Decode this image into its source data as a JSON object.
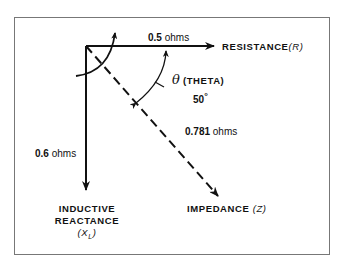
{
  "diagram": {
    "resistance": {
      "value": "0.5",
      "unit": "ohms",
      "label": "RESISTANCE",
      "symbol": "(R)"
    },
    "inductive_reactance": {
      "value": "0.6",
      "unit": "ohms",
      "label_line1": "INDUCTIVE",
      "label_line2": "REACTANCE",
      "symbol": "(X",
      "symbol_sub": "L",
      "symbol_close": ")"
    },
    "impedance": {
      "value": "0.781",
      "unit": "ohms",
      "label": "IMPEDANCE",
      "symbol": "(Z)"
    },
    "angle": {
      "symbol": "θ",
      "name": "(THETA)",
      "value": "50",
      "unit": "°"
    },
    "colors": {
      "line": "#111111",
      "frame": "#777777",
      "background": "#ffffff"
    }
  }
}
